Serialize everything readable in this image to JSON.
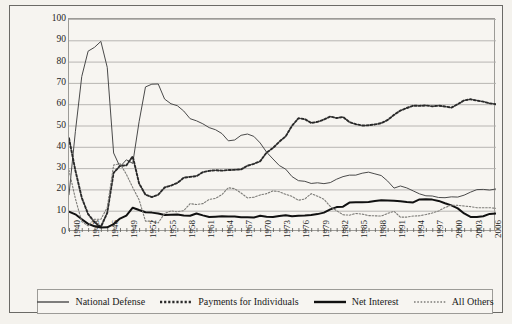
{
  "chart_data": {
    "type": "line",
    "title": "",
    "xlabel": "",
    "ylabel": "Percent",
    "ylim": [
      0,
      100
    ],
    "yticks": [
      0,
      10,
      20,
      30,
      40,
      50,
      60,
      70,
      80,
      90,
      100
    ],
    "xlim": [
      1940,
      2007
    ],
    "xticks": [
      1940,
      1943,
      1946,
      1949,
      1952,
      1955,
      1958,
      1961,
      1964,
      1967,
      1970,
      1973,
      1976,
      1979,
      1982,
      1985,
      1988,
      1991,
      1994,
      1997,
      2000,
      2003,
      2006
    ],
    "grid": "horizontal",
    "legend_position": "bottom",
    "x": [
      1940,
      1941,
      1942,
      1943,
      1944,
      1945,
      1946,
      1947,
      1948,
      1949,
      1950,
      1951,
      1952,
      1953,
      1954,
      1955,
      1956,
      1957,
      1958,
      1959,
      1960,
      1961,
      1962,
      1963,
      1964,
      1965,
      1966,
      1967,
      1968,
      1969,
      1970,
      1971,
      1972,
      1973,
      1974,
      1975,
      1976,
      1977,
      1978,
      1979,
      1980,
      1981,
      1982,
      1983,
      1984,
      1985,
      1986,
      1987,
      1988,
      1989,
      1990,
      1991,
      1992,
      1993,
      1994,
      1995,
      1996,
      1997,
      1998,
      1999,
      2000,
      2001,
      2002,
      2003,
      2004,
      2005,
      2006,
      2007
    ],
    "series": [
      {
        "name": "National Defense",
        "style": "solid-thin",
        "color": "#4a4a4a",
        "values": [
          17.5,
          47.1,
          73.0,
          84.9,
          86.7,
          89.5,
          77.3,
          37.1,
          30.6,
          33.9,
          32.2,
          51.8,
          68.1,
          69.4,
          69.5,
          62.4,
          60.2,
          59.3,
          56.8,
          53.2,
          52.2,
          50.8,
          49.0,
          48.0,
          46.2,
          42.8,
          43.2,
          45.4,
          46.0,
          44.9,
          41.8,
          37.5,
          34.3,
          31.2,
          29.5,
          26.0,
          24.1,
          23.8,
          22.8,
          23.1,
          22.7,
          23.2,
          24.8,
          26.0,
          26.7,
          26.7,
          27.6,
          28.1,
          27.3,
          26.5,
          23.9,
          20.6,
          21.6,
          20.7,
          19.3,
          17.9,
          17.0,
          16.9,
          16.2,
          16.1,
          16.5,
          16.4,
          17.3,
          18.7,
          19.9,
          20.0,
          19.7,
          20.2
        ]
      },
      {
        "name": "Payments for Individuals",
        "style": "dotted-bold",
        "color": "#2a2a2a",
        "values": [
          44.0,
          28.9,
          16.1,
          8.4,
          4.6,
          2.4,
          9.0,
          27.8,
          31.0,
          31.3,
          35.5,
          22.8,
          17.5,
          16.4,
          17.5,
          20.9,
          21.8,
          23.0,
          25.5,
          25.9,
          26.2,
          28.1,
          28.7,
          29.0,
          28.8,
          29.1,
          29.2,
          29.4,
          31.1,
          32.0,
          33.2,
          37.3,
          39.4,
          42.4,
          44.9,
          49.9,
          53.4,
          53.0,
          51.2,
          51.7,
          52.8,
          54.2,
          53.5,
          54.0,
          51.6,
          50.6,
          50.0,
          50.1,
          50.5,
          51.1,
          52.6,
          55.0,
          57.0,
          58.2,
          59.3,
          59.2,
          59.4,
          59.0,
          59.3,
          58.9,
          58.4,
          60.0,
          61.8,
          62.3,
          61.7,
          61.2,
          60.4,
          60.0
        ]
      },
      {
        "name": "Net Interest",
        "style": "solid-bold",
        "color": "#111111",
        "values": [
          9.5,
          8.3,
          6.0,
          3.8,
          2.7,
          2.1,
          2.2,
          3.7,
          6.3,
          7.7,
          11.4,
          10.3,
          9.3,
          9.1,
          8.7,
          8.0,
          8.1,
          8.2,
          7.7,
          7.6,
          8.7,
          7.8,
          7.0,
          7.2,
          7.4,
          7.3,
          7.3,
          6.9,
          6.9,
          6.8,
          7.6,
          7.2,
          7.0,
          7.5,
          7.9,
          7.4,
          7.6,
          7.7,
          8.0,
          8.4,
          9.1,
          10.6,
          11.7,
          11.9,
          13.8,
          14.0,
          14.0,
          14.1,
          14.6,
          14.9,
          14.8,
          14.7,
          14.4,
          14.1,
          13.9,
          15.3,
          15.4,
          15.2,
          14.6,
          13.5,
          12.5,
          11.1,
          8.7,
          7.1,
          7.0,
          7.4,
          8.5,
          8.7
        ]
      },
      {
        "name": "All Others",
        "style": "dotted-thin",
        "color": "#7d7c78",
        "values": [
          29.0,
          15.7,
          4.9,
          2.9,
          6.0,
          6.0,
          11.5,
          31.4,
          32.1,
          27.1,
          20.9,
          15.1,
          5.1,
          5.1,
          4.3,
          8.7,
          9.9,
          9.5,
          10.0,
          13.3,
          12.9,
          13.3,
          15.3,
          15.8,
          17.6,
          20.8,
          20.3,
          18.3,
          16.0,
          16.3,
          17.4,
          18.0,
          19.3,
          18.9,
          17.7,
          16.7,
          14.9,
          15.5,
          18.0,
          16.8,
          15.4,
          12.0,
          10.0,
          8.1,
          7.9,
          8.7,
          8.4,
          7.7,
          7.6,
          7.5,
          8.7,
          9.7,
          7.0,
          7.0,
          7.5,
          7.6,
          8.2,
          8.9,
          9.9,
          11.5,
          12.6,
          12.5,
          12.2,
          11.9,
          11.4,
          11.4,
          11.4,
          11.1
        ]
      }
    ]
  },
  "legend": {
    "items": [
      {
        "label": "National Defense",
        "style": "solid-thin"
      },
      {
        "label": "Payments for Individuals",
        "style": "dotted-bold"
      },
      {
        "label": "Net Interest",
        "style": "solid-bold"
      },
      {
        "label": "All Others",
        "style": "dotted-thin"
      }
    ]
  }
}
